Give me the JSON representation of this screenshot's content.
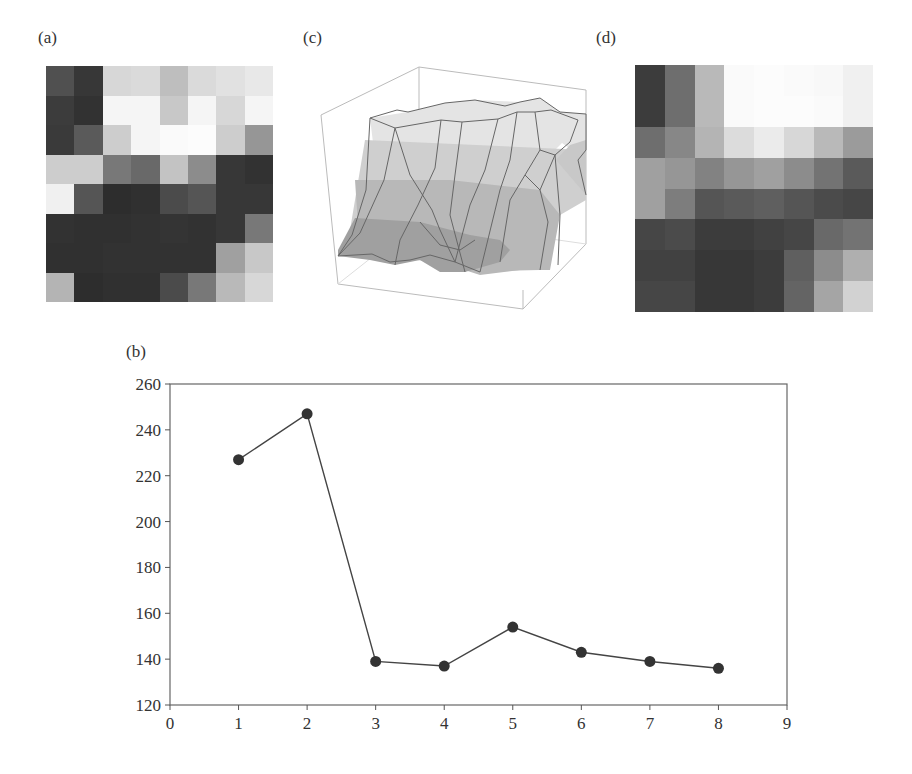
{
  "figure": {
    "panels": {
      "a": {
        "label": "(a)",
        "type": "grayscale-image-8x8",
        "gray": [
          [
            80,
            55,
            215,
            218,
            190,
            218,
            225,
            232
          ],
          [
            60,
            50,
            245,
            245,
            200,
            245,
            215,
            245
          ],
          [
            58,
            90,
            205,
            245,
            250,
            252,
            205,
            150
          ],
          [
            205,
            205,
            120,
            105,
            195,
            140,
            55,
            50
          ],
          [
            240,
            85,
            45,
            48,
            75,
            85,
            55,
            55
          ],
          [
            50,
            48,
            48,
            50,
            52,
            50,
            55,
            120
          ],
          [
            48,
            48,
            50,
            50,
            50,
            50,
            160,
            200
          ],
          [
            180,
            45,
            48,
            48,
            75,
            120,
            185,
            215
          ]
        ]
      },
      "c": {
        "label": "(c)",
        "type": "3d-surface"
      },
      "d": {
        "label": "(d)",
        "type": "grayscale-image-8x8",
        "gray": [
          [
            60,
            110,
            185,
            250,
            252,
            250,
            248,
            240
          ],
          [
            60,
            110,
            185,
            250,
            252,
            252,
            250,
            240
          ],
          [
            110,
            135,
            180,
            220,
            235,
            215,
            185,
            155
          ],
          [
            160,
            150,
            130,
            150,
            160,
            140,
            115,
            90
          ],
          [
            160,
            125,
            85,
            90,
            95,
            85,
            75,
            70
          ],
          [
            70,
            75,
            60,
            60,
            65,
            70,
            105,
            115
          ],
          [
            65,
            65,
            55,
            55,
            60,
            95,
            140,
            175
          ],
          [
            70,
            70,
            55,
            55,
            60,
            100,
            165,
            210
          ]
        ]
      },
      "b": {
        "label": "(b)"
      }
    }
  },
  "chart_data": {
    "type": "line",
    "title": "",
    "panel_label": "(b)",
    "xlabel": "",
    "ylabel": "",
    "x": [
      1,
      2,
      3,
      4,
      5,
      6,
      7,
      8
    ],
    "series": [
      {
        "name": "series-1",
        "values": [
          227,
          247,
          139,
          137,
          154,
          143,
          139,
          136
        ],
        "marker": "filled-circle",
        "color": "#333333"
      }
    ],
    "xlim": [
      0,
      9
    ],
    "ylim": [
      120,
      260
    ],
    "xticks": [
      "0",
      "1",
      "2",
      "3",
      "4",
      "5",
      "6",
      "7",
      "8",
      "9"
    ],
    "yticks": [
      "120",
      "140",
      "160",
      "180",
      "200",
      "220",
      "240",
      "260"
    ],
    "grid": false,
    "legend": "none"
  }
}
